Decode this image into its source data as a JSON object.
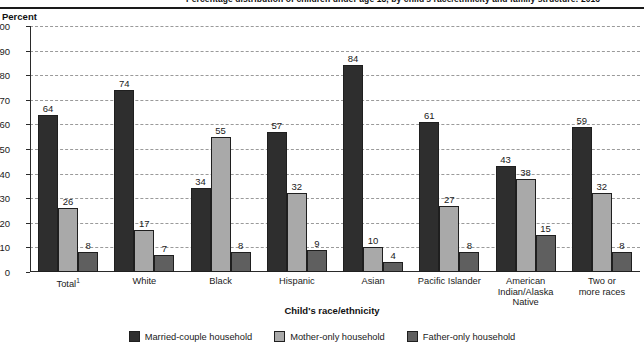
{
  "title": "Percentage distribution of children under age 18, by child's race/ethnicity and family structure: 2016",
  "yaxis_label": "Percent",
  "xaxis_label": "Child's race/ethnicity",
  "colors": {
    "married": "#2e2e2e",
    "mother": "#a9a9a9",
    "father": "#5f5f5f",
    "gridline": "#9a9a9a",
    "axis": "#2a2a2a"
  },
  "chart_data": {
    "type": "bar",
    "title": "Percentage distribution of children under age 18, by child's race/ethnicity and family structure: 2016",
    "xlabel": "Child's race/ethnicity",
    "ylabel": "Percent",
    "ylim": [
      0,
      100
    ],
    "ytick_labels": [
      "100",
      "90",
      "80",
      "70",
      "60",
      "50",
      "40",
      "30",
      "20",
      "10",
      "0"
    ],
    "yticks": [
      100,
      90,
      80,
      70,
      60,
      50,
      40,
      30,
      20,
      10,
      0
    ],
    "grid": true,
    "legend_position": "bottom",
    "categories": [
      "Total¹",
      "White",
      "Black",
      "Hispanic",
      "Asian",
      "Pacific Islander",
      "American Indian/Alaska Native",
      "Two or more races"
    ],
    "category_lines": [
      [
        "Total",
        "",
        ""
      ],
      [
        "White",
        "",
        ""
      ],
      [
        "Black",
        "",
        ""
      ],
      [
        "Hispanic",
        "",
        ""
      ],
      [
        "Asian",
        "",
        ""
      ],
      [
        "Pacific Islander",
        "",
        ""
      ],
      [
        "American",
        "Indian/Alaska",
        "Native"
      ],
      [
        "Two or",
        "more races",
        ""
      ]
    ],
    "series": [
      {
        "name": "Married-couple household",
        "color": "#2e2e2e",
        "values": [
          64,
          74,
          34,
          57,
          84,
          61,
          43,
          59
        ]
      },
      {
        "name": "Mother-only household",
        "color": "#a9a9a9",
        "values": [
          26,
          17,
          55,
          32,
          10,
          27,
          38,
          32
        ]
      },
      {
        "name": "Father-only household",
        "color": "#5f5f5f",
        "values": [
          8,
          7,
          8,
          9,
          4,
          8,
          15,
          8
        ]
      }
    ]
  }
}
